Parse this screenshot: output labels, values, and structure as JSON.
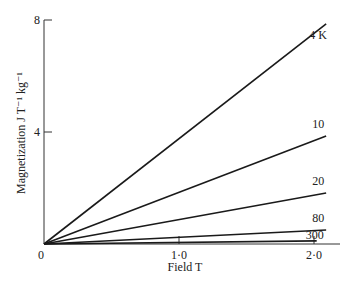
{
  "chart_data": {
    "type": "line",
    "title": "",
    "xlabel": "Field T",
    "ylabel": "Magnetization J T⁻¹ kg⁻¹",
    "xlim": [
      0,
      2.2
    ],
    "ylim": [
      0,
      8
    ],
    "x_ticks": [
      {
        "value": 0,
        "label": "0"
      },
      {
        "value": 1.0,
        "label": "1·0"
      },
      {
        "value": 2.0,
        "label": "2·0"
      }
    ],
    "y_ticks": [
      {
        "value": 4,
        "label": "4"
      },
      {
        "value": 8,
        "label": "8"
      }
    ],
    "grid": false,
    "legend": "inline-right",
    "series": [
      {
        "name": "4 K",
        "x": [
          0,
          2.09
        ],
        "y": [
          0,
          7.86
        ]
      },
      {
        "name": "10",
        "x": [
          0,
          2.09
        ],
        "y": [
          0,
          3.86
        ]
      },
      {
        "name": "20",
        "x": [
          0,
          2.09
        ],
        "y": [
          0,
          1.82
        ]
      },
      {
        "name": "80",
        "x": [
          0,
          2.09
        ],
        "y": [
          0,
          0.5
        ]
      },
      {
        "name": "300",
        "x": [
          0,
          2.02
        ],
        "y": [
          0,
          0.11
        ]
      }
    ]
  }
}
